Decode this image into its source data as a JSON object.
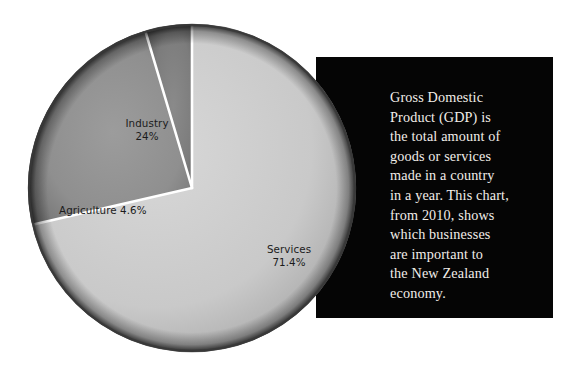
{
  "chart_data": {
    "type": "pie",
    "title": "",
    "subtitle": "",
    "xlabel": "",
    "ylabel": "",
    "legend_position": "on-slice-labels",
    "grid": false,
    "units": "percent of GDP",
    "categories": [
      "Services",
      "Industry",
      "Agriculture"
    ],
    "values": [
      71.4,
      24,
      4.6
    ],
    "slices": [
      {
        "name": "Services",
        "value": 71.4,
        "value_label": "71.4%",
        "label": "Services\n71.4%",
        "color": "#c9c9c9",
        "start_angle_deg": 0,
        "end_angle_deg": 257.04
      },
      {
        "name": "Industry",
        "value": 24,
        "value_label": "24%",
        "label": "Industry\n24%",
        "color": "#8f8f8f",
        "start_angle_deg": 257.04,
        "end_angle_deg": 343.44
      },
      {
        "name": "Agriculture",
        "value": 4.6,
        "value_label": "4.6%",
        "label": "Agriculture 4.6%",
        "color": "#7c7c7c",
        "start_angle_deg": 343.44,
        "end_angle_deg": 360
      }
    ],
    "divider_color": "#ffffff",
    "rim_color": "#3a3a3a"
  },
  "info_panel": {
    "background": "#050505",
    "text_color": "#f2eee9",
    "body": "Gross Domestic\nProduct (GDP) is\nthe total amount of\ngoods or services\nmade in a country\nin a year. This chart,\nfrom 2010, shows\nwhich businesses\nare important to\nthe New Zealand\neconomy."
  }
}
